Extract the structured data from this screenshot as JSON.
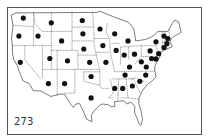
{
  "map": {
    "label": "273",
    "dot_color": "#111111",
    "line_color": "#444444",
    "markers": [
      {
        "region": "Washington",
        "lon": -120.5,
        "lat": 47.8
      },
      {
        "region": "Oregon",
        "lon": -122.0,
        "lat": 44.0
      },
      {
        "region": "Idaho",
        "lon": -115.5,
        "lat": 44.0
      },
      {
        "region": "Montana",
        "lon": -111.0,
        "lat": 46.8
      },
      {
        "region": "California",
        "lon": -121.5,
        "lat": 38.5
      },
      {
        "region": "Wyoming",
        "lon": -107.5,
        "lat": 43.0
      },
      {
        "region": "Utah",
        "lon": -111.5,
        "lat": 39.3
      },
      {
        "region": "Colorado",
        "lon": -105.5,
        "lat": 38.8
      },
      {
        "region": "Arizona",
        "lon": -112.0,
        "lat": 34.0
      },
      {
        "region": "New Mexico",
        "lon": -106.5,
        "lat": 34.0
      },
      {
        "region": "North Dakota",
        "lon": -100.5,
        "lat": 47.3
      },
      {
        "region": "South Dakota",
        "lon": -100.3,
        "lat": 44.5
      },
      {
        "region": "Nebraska",
        "lon": -100.0,
        "lat": 41.3
      },
      {
        "region": "Kansas",
        "lon": -98.0,
        "lat": 38.5
      },
      {
        "region": "Oklahoma",
        "lon": -97.5,
        "lat": 35.5
      },
      {
        "region": "Texas",
        "lon": -97.5,
        "lat": 31.0
      },
      {
        "region": "Minnesota",
        "lon": -94.5,
        "lat": 45.5
      },
      {
        "region": "Iowa",
        "lon": -93.5,
        "lat": 42.0
      },
      {
        "region": "Missouri",
        "lon": -92.5,
        "lat": 38.5
      },
      {
        "region": "Wisconsin",
        "lon": -89.5,
        "lat": 44.5
      },
      {
        "region": "Illinois",
        "lon": -89.0,
        "lat": 41.0
      },
      {
        "region": "Michigan",
        "lon": -85.0,
        "lat": 43.0
      },
      {
        "region": "Indiana",
        "lon": -86.3,
        "lat": 40.0
      },
      {
        "region": "Ohio",
        "lon": -82.8,
        "lat": 40.2
      },
      {
        "region": "Kentucky",
        "lon": -84.5,
        "lat": 37.5
      },
      {
        "region": "Tennessee",
        "lon": -86.0,
        "lat": 35.8
      },
      {
        "region": "Mississippi",
        "lon": -89.5,
        "lat": 33.0
      },
      {
        "region": "Alabama",
        "lon": -86.8,
        "lat": 33.0
      },
      {
        "region": "Georgia",
        "lon": -83.5,
        "lat": 33.5
      },
      {
        "region": "South Carolina",
        "lon": -81.0,
        "lat": 34.5
      },
      {
        "region": "North Carolina",
        "lon": -79.0,
        "lat": 35.8
      },
      {
        "region": "Virginia",
        "lon": -78.8,
        "lat": 37.5
      },
      {
        "region": "West Virginia",
        "lon": -80.5,
        "lat": 38.6
      },
      {
        "region": "Maryland",
        "lon": -77.0,
        "lat": 39.3
      },
      {
        "region": "Delaware",
        "lon": -75.5,
        "lat": 39.2
      },
      {
        "region": "Pennsylvania",
        "lon": -77.5,
        "lat": 40.9
      },
      {
        "region": "New Jersey",
        "lon": -74.6,
        "lat": 40.3
      },
      {
        "region": "New York",
        "lon": -75.5,
        "lat": 42.8
      },
      {
        "region": "Connecticut",
        "lon": -72.8,
        "lat": 41.6
      },
      {
        "region": "Massachusetts",
        "lon": -71.8,
        "lat": 42.4
      },
      {
        "region": "Vermont",
        "lon": -72.8,
        "lat": 44.0
      },
      {
        "region": "New Hampshire",
        "lon": -71.5,
        "lat": 43.5
      }
    ]
  }
}
